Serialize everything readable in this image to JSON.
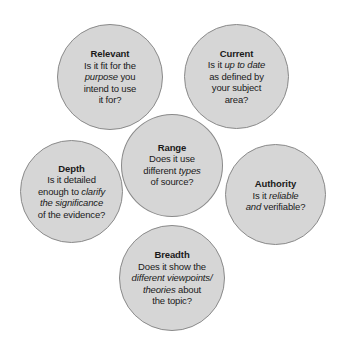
{
  "diagram": {
    "background_color": "#ffffff",
    "circle_fill_color": "#d6d6d6",
    "circle_border_color": "#8a8a8a",
    "text_color": "#1a1a1a",
    "circles": [
      {
        "id": "relevant",
        "position": "top-left",
        "title": "Relevant",
        "lines": [
          [
            {
              "t": "Is it fit for the",
              "i": false
            }
          ],
          [
            {
              "t": "purpose",
              "i": true
            },
            {
              "t": " you",
              "i": false
            }
          ],
          [
            {
              "t": "intend to use",
              "i": false
            }
          ],
          [
            {
              "t": "it for?",
              "i": false
            }
          ]
        ],
        "plain_text": "Relevant Is it fit for the purpose you intend to use it for?"
      },
      {
        "id": "current",
        "position": "top-right",
        "title": "Current",
        "lines": [
          [
            {
              "t": "Is it ",
              "i": false
            },
            {
              "t": "up to date",
              "i": true
            }
          ],
          [
            {
              "t": "as defined by",
              "i": false
            }
          ],
          [
            {
              "t": "your subject",
              "i": false
            }
          ],
          [
            {
              "t": "area?",
              "i": false
            }
          ]
        ],
        "plain_text": "Current Is it up to date as defined by your subject area?"
      },
      {
        "id": "range",
        "position": "center",
        "title": "Range",
        "lines": [
          [
            {
              "t": "Does it use",
              "i": false
            }
          ],
          [
            {
              "t": "different ",
              "i": false
            },
            {
              "t": "types",
              "i": true
            }
          ],
          [
            {
              "t": "of source?",
              "i": false
            }
          ]
        ],
        "plain_text": "Range Does it use different types of source?"
      },
      {
        "id": "depth",
        "position": "left",
        "title": "Depth",
        "lines": [
          [
            {
              "t": "Is it detailed",
              "i": false
            }
          ],
          [
            {
              "t": "enough to ",
              "i": false
            },
            {
              "t": "clarify",
              "i": true
            }
          ],
          [
            {
              "t": "the significance",
              "i": true
            }
          ],
          [
            {
              "t": "of the evidence?",
              "i": false
            }
          ]
        ],
        "plain_text": "Depth Is it detailed enough to clarify the significance of the evidence?"
      },
      {
        "id": "authority",
        "position": "right",
        "title": "Authority",
        "lines": [
          [
            {
              "t": "Is it ",
              "i": false
            },
            {
              "t": "reliable",
              "i": true
            }
          ],
          [
            {
              "t": "and",
              "i": true
            },
            {
              "t": " verifiable?",
              "i": false
            }
          ]
        ],
        "plain_text": "Authority Is it reliable and verifiable?"
      },
      {
        "id": "breadth",
        "position": "bottom",
        "title": "Breadth",
        "lines": [
          [
            {
              "t": "Does it show the",
              "i": false
            }
          ],
          [
            {
              "t": "different viewpoints/",
              "i": true
            }
          ],
          [
            {
              "t": "theories",
              "i": true
            },
            {
              "t": " about",
              "i": false
            }
          ],
          [
            {
              "t": "the topic?",
              "i": false
            }
          ]
        ],
        "plain_text": "Breadth Does it show the different viewpoints/ theories about the topic?"
      }
    ]
  }
}
